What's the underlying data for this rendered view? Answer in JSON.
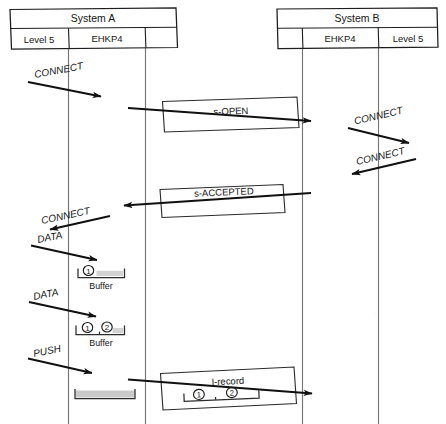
{
  "diagram": {
    "kind": "sequence-diagram",
    "title_visible": false,
    "background_color": "#ffffff",
    "ink_color": "#151515",
    "lifeline_color": "#767676",
    "buffer_fill_color": "#d3d3d3",
    "width": 446,
    "height": 424
  },
  "systems": [
    {
      "id": "system-a",
      "name": "System A",
      "columns": [
        {
          "id": "a-level5",
          "label": "Level 5"
        },
        {
          "id": "a-ehkp4",
          "label": "EHKP4"
        },
        {
          "id": "a-blank",
          "label": ""
        }
      ]
    },
    {
      "id": "system-b",
      "name": "System B",
      "columns": [
        {
          "id": "b-blank",
          "label": ""
        },
        {
          "id": "b-ehkp4",
          "label": "EHKP4"
        },
        {
          "id": "b-level5",
          "label": "Level 5"
        }
      ]
    }
  ],
  "messages": [
    {
      "id": "msg-connect-a-down",
      "label": "CONNECT",
      "style": "handwritten-italic",
      "direction": "right",
      "system": "system-a"
    },
    {
      "id": "msg-s-open",
      "label": "s-OPEN",
      "style": "boxed",
      "direction": "right",
      "system": "link"
    },
    {
      "id": "msg-connect-b-right",
      "label": "CONNECT",
      "style": "handwritten-italic",
      "direction": "right",
      "system": "system-b"
    },
    {
      "id": "msg-connect-b-left",
      "label": "CONNECT",
      "style": "handwritten-italic",
      "direction": "left",
      "system": "system-b"
    },
    {
      "id": "msg-s-accepted",
      "label": "s-ACCEPTED",
      "style": "boxed",
      "direction": "left",
      "system": "link"
    },
    {
      "id": "msg-connect-a-up",
      "label": "CONNECT",
      "style": "handwritten-italic",
      "direction": "left",
      "system": "system-a"
    },
    {
      "id": "msg-data-1",
      "label": "DATA",
      "style": "handwritten-italic",
      "direction": "right",
      "system": "system-a"
    },
    {
      "id": "msg-data-2",
      "label": "DATA",
      "style": "handwritten-italic",
      "direction": "right",
      "system": "system-a"
    },
    {
      "id": "msg-push",
      "label": "PUSH",
      "style": "handwritten-italic",
      "direction": "right",
      "system": "system-a"
    },
    {
      "id": "msg-i-record",
      "label": "I-record",
      "style": "boxed",
      "direction": "right",
      "system": "link"
    }
  ],
  "buffers": [
    {
      "id": "buffer-1",
      "caption": "Buffer",
      "items": [
        "1"
      ],
      "empty_slots": 1,
      "filled": true
    },
    {
      "id": "buffer-2",
      "caption": "Buffer",
      "items": [
        "1",
        "2"
      ],
      "empty_slots": 1,
      "filled": true
    },
    {
      "id": "buffer-3",
      "caption": "",
      "items": [],
      "empty_slots": 0,
      "filled": true
    }
  ],
  "record_payload": {
    "id": "i-record-payload",
    "label": "I-record",
    "items": [
      "1",
      "2"
    ]
  },
  "item_markers": {
    "one": "1",
    "two": "2"
  }
}
